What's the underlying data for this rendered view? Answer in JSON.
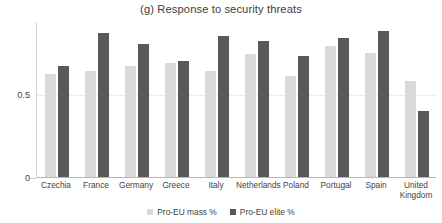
{
  "chart_data": {
    "type": "bar",
    "title": "(g) Response to security threats",
    "xlabel": "",
    "ylabel": "",
    "ylim": [
      0,
      0.94
    ],
    "grid": true,
    "legend_position": "bottom-center",
    "ytick_labels": [
      "0",
      "0.5"
    ],
    "ytick_values": [
      0,
      0.5
    ],
    "categories": [
      "Czechia",
      "France",
      "Germany",
      "Greece",
      "Italy",
      "Netherlands",
      "Poland",
      "Portugal",
      "Spain",
      "United Kingdom"
    ],
    "series": [
      {
        "name": "Pro-EU mass %",
        "color": "#d9d9d9",
        "values": [
          0.62,
          0.64,
          0.67,
          0.69,
          0.64,
          0.74,
          0.61,
          0.79,
          0.75,
          0.58
        ]
      },
      {
        "name": "Pro-EU elite %",
        "color": "#595959",
        "values": [
          0.67,
          0.87,
          0.8,
          0.7,
          0.85,
          0.82,
          0.73,
          0.84,
          0.88,
          0.4
        ]
      }
    ]
  },
  "legend": {
    "entries": [
      {
        "label": "Pro-EU mass %",
        "swatch": "mass"
      },
      {
        "label": "Pro-EU elite %",
        "swatch": "elite"
      }
    ]
  },
  "axis": {
    "y_tick_0": "0",
    "y_tick_half": "0.5"
  }
}
